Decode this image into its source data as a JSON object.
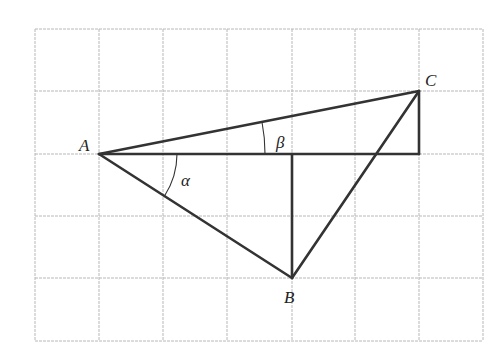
{
  "diagram": {
    "type": "geometry-grid",
    "grid": {
      "columns": 7,
      "rows": 5,
      "line_color": "#b8b8b8"
    },
    "points": {
      "A": {
        "label": "A",
        "grid": [
          1,
          2
        ]
      },
      "B": {
        "label": "B",
        "grid": [
          4,
          4
        ]
      },
      "C": {
        "label": "C",
        "grid": [
          6,
          1
        ]
      }
    },
    "angles": {
      "alpha": {
        "label": "α",
        "vertex": "A",
        "between": [
          "AD",
          "AB"
        ]
      },
      "beta": {
        "label": "β",
        "vertex": "A",
        "between": [
          "AD",
          "AC"
        ]
      }
    },
    "segments": [
      "AC",
      "AB",
      "BC",
      "AD",
      "CD",
      "B-vertical"
    ],
    "line_color": "#333333"
  }
}
